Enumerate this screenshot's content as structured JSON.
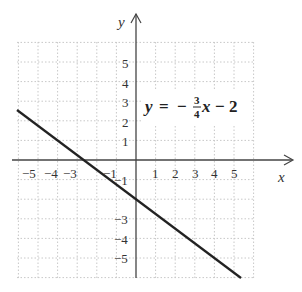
{
  "chart_data": {
    "type": "line",
    "title": "",
    "equation": {
      "lhs": "y",
      "equals": "=",
      "minus": "−",
      "numerator": "3",
      "denominator": "4",
      "var": "x",
      "tail": "− 2",
      "full": "y = −(3/4)x − 2"
    },
    "xlabel": "x",
    "ylabel": "y",
    "xlim": [
      -6,
      6
    ],
    "ylim": [
      -6,
      6
    ],
    "grid": true,
    "x_ticks": [
      "−5",
      "−4",
      "−3",
      "−1",
      "1",
      "2",
      "3",
      "4",
      "5"
    ],
    "y_ticks_pos": [
      "5",
      "4",
      "3",
      "2",
      "1"
    ],
    "y_ticks_neg": [
      "−1",
      "−3",
      "−4",
      "−5"
    ],
    "series": [
      {
        "name": "y = -3/4 x - 2",
        "slope": -0.75,
        "intercept": -2,
        "x": [
          -6.1,
          -4,
          -2.67,
          0,
          4,
          5.4
        ],
        "y": [
          2.58,
          1,
          0,
          -2,
          -5,
          -6.05
        ]
      }
    ]
  }
}
